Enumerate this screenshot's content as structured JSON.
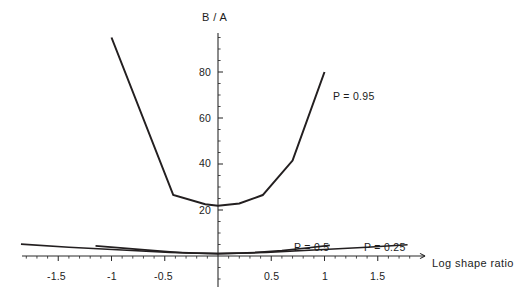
{
  "chart_data": {
    "type": "line",
    "title": "",
    "xlabel": "Log shape ratio",
    "ylabel": "B / A",
    "xlim": [
      -1.95,
      1.95
    ],
    "ylim": [
      0,
      96
    ],
    "grid": false,
    "legend_position": "inline-annotations",
    "x_ticks": [
      -1.5,
      -1,
      -0.5,
      0.5,
      1,
      1.5
    ],
    "x_tick_labels": [
      "-1.5",
      "-1",
      "-0.5",
      "0.5",
      "1",
      "1.5"
    ],
    "y_ticks": [
      20,
      40,
      60,
      80
    ],
    "y_tick_labels": [
      "20",
      "40",
      "60",
      "80"
    ],
    "minor_tick_step_x": 0.1,
    "minor_tick_step_y": 5,
    "series": [
      {
        "name": "P = 0.95",
        "label": "P = 0.95",
        "label_x": 1.08,
        "label_y": 69,
        "x": [
          -1.0,
          -0.42,
          -0.12,
          0.0,
          0.2,
          0.42,
          0.7,
          1.0
        ],
        "y": [
          95,
          26.5,
          22.5,
          21.8,
          22.8,
          26.5,
          41.5,
          80
        ]
      },
      {
        "name": "P = 0.5",
        "label": "P = 0.5",
        "label_x": 0.53,
        "label_y": 13,
        "x": [
          -1.15,
          -0.6,
          -0.3,
          0.0,
          0.3,
          0.6,
          0.85,
          1.05
        ],
        "y": [
          4.4,
          2.3,
          1.3,
          1.0,
          1.3,
          2.3,
          3.6,
          4.6
        ]
      },
      {
        "name": "P = 0.25",
        "label": "P = 0.25",
        "label_x": 1.22,
        "label_y": 13,
        "x": [
          -1.85,
          -1.4,
          -0.9,
          -0.45,
          0.0,
          0.45,
          0.9,
          1.4,
          1.78
        ],
        "y": [
          5.2,
          3.8,
          2.6,
          1.6,
          1.0,
          1.6,
          2.6,
          3.8,
          4.9
        ]
      }
    ]
  },
  "labels": {
    "y_axis_title": "B / A",
    "x_axis_title": "Log shape ratio",
    "y_tick_20": "20",
    "y_tick_40": "40",
    "y_tick_60": "60",
    "y_tick_80": "80",
    "x_tick_neg15": "-1.5",
    "x_tick_neg1": "-1",
    "x_tick_neg05": "-0.5",
    "x_tick_05": "0.5",
    "x_tick_1": "1",
    "x_tick_15": "1.5",
    "series_95": "P = 0.95",
    "series_5": "P = 0.5",
    "series_25": "P = 0.25"
  },
  "colors": {
    "background": "#ffffff",
    "axis": "#2b2b2b",
    "curve": "#231f20",
    "text": "#1c1c1c"
  }
}
